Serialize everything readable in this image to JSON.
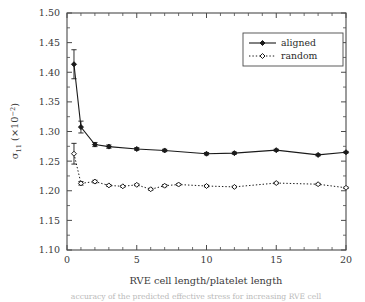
{
  "figure": {
    "background_color": "#ffffff",
    "frame_color": "#4a4a4a",
    "caption_partial": "accuracy of the predicted effective stress for increasing RVE cell"
  },
  "chart_data": {
    "type": "line",
    "title": "",
    "xlabel": "RVE cell length/platelet length",
    "ylabel_base": "σ",
    "ylabel_sub": "11",
    "ylabel_mid": " (×10",
    "ylabel_sup": "−2",
    "ylabel_close": ")",
    "ylabel_plain": "σ11 (×10⁻²)",
    "xlim": [
      0,
      20
    ],
    "ylim": [
      1.1,
      1.5
    ],
    "xticks": [
      0,
      5,
      10,
      15,
      20
    ],
    "xtick_labels": [
      "0",
      "5",
      "10",
      "15",
      "20"
    ],
    "xminor_ticks": [
      1,
      2,
      3,
      4,
      6,
      7,
      8,
      9,
      11,
      12,
      13,
      14,
      16,
      17,
      18,
      19
    ],
    "yticks": [
      1.1,
      1.15,
      1.2,
      1.25,
      1.3,
      1.35,
      1.4,
      1.45,
      1.5
    ],
    "ytick_labels": [
      "1.10",
      "1.15",
      "1.20",
      "1.25",
      "1.30",
      "1.35",
      "1.40",
      "1.45",
      "1.50"
    ],
    "grid": false,
    "legend_position": "upper-right",
    "legend_entries": [
      "aligned",
      "random"
    ],
    "series": [
      {
        "name": "aligned",
        "line_style": "solid",
        "marker": "filled-diamond",
        "color": "#1a1a1a",
        "x": [
          0.5,
          1.0,
          2.0,
          3.0,
          5.0,
          7.0,
          10.0,
          12.0,
          15.0,
          18.0,
          20.0
        ],
        "y": [
          1.4135,
          1.3075,
          1.278,
          1.2745,
          1.2705,
          1.268,
          1.2625,
          1.2635,
          1.2685,
          1.2605,
          1.265
        ],
        "yerr": [
          0.0245,
          0.01,
          0.0035,
          0.0028,
          0.0022,
          0.002,
          0.002,
          0.0018,
          0.0016,
          0.0016,
          0.0014
        ]
      },
      {
        "name": "random",
        "line_style": "dotted",
        "marker": "open-diamond",
        "color": "#1a1a1a",
        "x": [
          0.5,
          1.0,
          2.0,
          3.0,
          4.0,
          5.0,
          6.0,
          7.0,
          8.0,
          10.0,
          12.0,
          15.0,
          18.0,
          20.0
        ],
        "y": [
          1.2625,
          1.2125,
          1.2155,
          1.209,
          1.2075,
          1.21,
          1.2025,
          1.2085,
          1.2105,
          1.208,
          1.2065,
          1.213,
          1.211,
          1.205
        ],
        "yerr": [
          0.0175,
          0.003,
          0.0022,
          0.0016,
          0.0014,
          0.0014,
          0.0016,
          0.0018,
          0.0014,
          0.0014,
          0.0012,
          0.0012,
          0.0014,
          0.0012
        ]
      }
    ]
  }
}
